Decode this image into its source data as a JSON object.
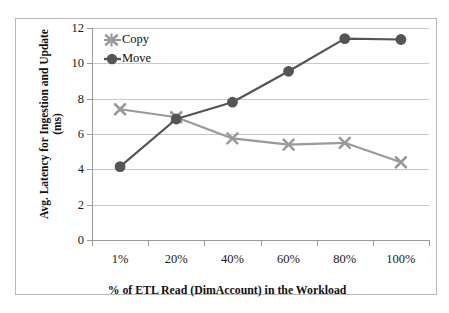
{
  "chart_data": {
    "type": "line",
    "title": "",
    "xlabel": "% of ETL Read (DimAccount) in the Workload",
    "ylabel": "Avg. Latency for Ingestion and Update",
    "ylabel_unit": "(ms)",
    "categories": [
      "1%",
      "20%",
      "40%",
      "60%",
      "80%",
      "100%"
    ],
    "ylim": [
      0,
      12
    ],
    "yticks": [
      0,
      2,
      4,
      6,
      8,
      10,
      12
    ],
    "ytick_labels": [
      "0",
      "2",
      "4",
      "6",
      "8",
      "10",
      "12"
    ],
    "grid": true,
    "legend_position": "top-left",
    "series": [
      {
        "name": "Copy",
        "marker": "x-cross",
        "color": "#9a9a9a",
        "values": [
          7.4,
          6.95,
          5.75,
          5.4,
          5.5,
          4.4
        ]
      },
      {
        "name": "Move",
        "marker": "filled-circle",
        "color": "#555555",
        "values": [
          4.15,
          6.85,
          7.8,
          9.55,
          11.4,
          11.35
        ]
      }
    ]
  },
  "colors": {
    "copy": "#9a9a9a",
    "move": "#555555",
    "gridline": "#c8c8c8",
    "axis": "#9a9a9a",
    "frame": "#b9b9b9",
    "text": "#1a1a1a",
    "background": "#ffffff"
  }
}
